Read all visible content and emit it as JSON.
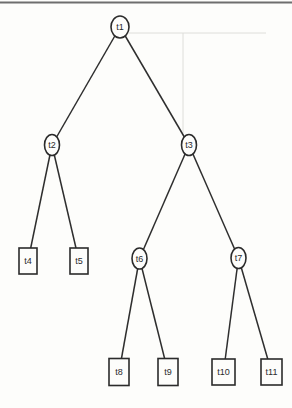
{
  "page": {
    "background": "#fdfdfb",
    "top_rule": {
      "color": "#6e6e6e",
      "y": 2.5,
      "thickness": 2
    }
  },
  "colors": {
    "edge": "#2e2e2e",
    "node_stroke": "#2b2b2b",
    "node_fill": "#fdfdfb",
    "label": "#2b2b2b",
    "artifact": "#dededa"
  },
  "tree": {
    "description": "binary tree diagram",
    "nodes": [
      {
        "id": "t1",
        "label": "t1",
        "shape": "ellipse",
        "x": 120,
        "y": 27,
        "rx": 9,
        "ry": 11
      },
      {
        "id": "t2",
        "label": "t2",
        "shape": "ellipse",
        "x": 52,
        "y": 145,
        "rx": 7.5,
        "ry": 10.5
      },
      {
        "id": "t3",
        "label": "t3",
        "shape": "ellipse",
        "x": 189,
        "y": 145,
        "rx": 7.5,
        "ry": 10.5
      },
      {
        "id": "t4",
        "label": "t4",
        "shape": "rect",
        "x": 28,
        "y": 261,
        "w": 18,
        "h": 26
      },
      {
        "id": "t5",
        "label": "t5",
        "shape": "rect",
        "x": 79,
        "y": 261,
        "w": 18,
        "h": 26
      },
      {
        "id": "t6",
        "label": "t6",
        "shape": "ellipse",
        "x": 139.5,
        "y": 258.5,
        "rx": 7.5,
        "ry": 10.5
      },
      {
        "id": "t7",
        "label": "t7",
        "shape": "ellipse",
        "x": 238.5,
        "y": 258,
        "rx": 7.5,
        "ry": 10.5
      },
      {
        "id": "t8",
        "label": "t8",
        "shape": "rect",
        "x": 119,
        "y": 372,
        "w": 20,
        "h": 27
      },
      {
        "id": "t9",
        "label": "t9",
        "shape": "rect",
        "x": 168,
        "y": 372,
        "w": 20,
        "h": 27
      },
      {
        "id": "t10",
        "label": "t10",
        "shape": "rect",
        "x": 223.5,
        "y": 372,
        "w": 23,
        "h": 26
      },
      {
        "id": "t11",
        "label": "t11",
        "shape": "rect",
        "x": 271.5,
        "y": 372,
        "w": 21,
        "h": 26
      }
    ],
    "edges": [
      [
        "t1",
        "t2"
      ],
      [
        "t1",
        "t3"
      ],
      [
        "t2",
        "t4"
      ],
      [
        "t2",
        "t5"
      ],
      [
        "t3",
        "t6"
      ],
      [
        "t3",
        "t7"
      ],
      [
        "t6",
        "t8"
      ],
      [
        "t6",
        "t9"
      ],
      [
        "t7",
        "t10"
      ],
      [
        "t7",
        "t11"
      ]
    ]
  }
}
